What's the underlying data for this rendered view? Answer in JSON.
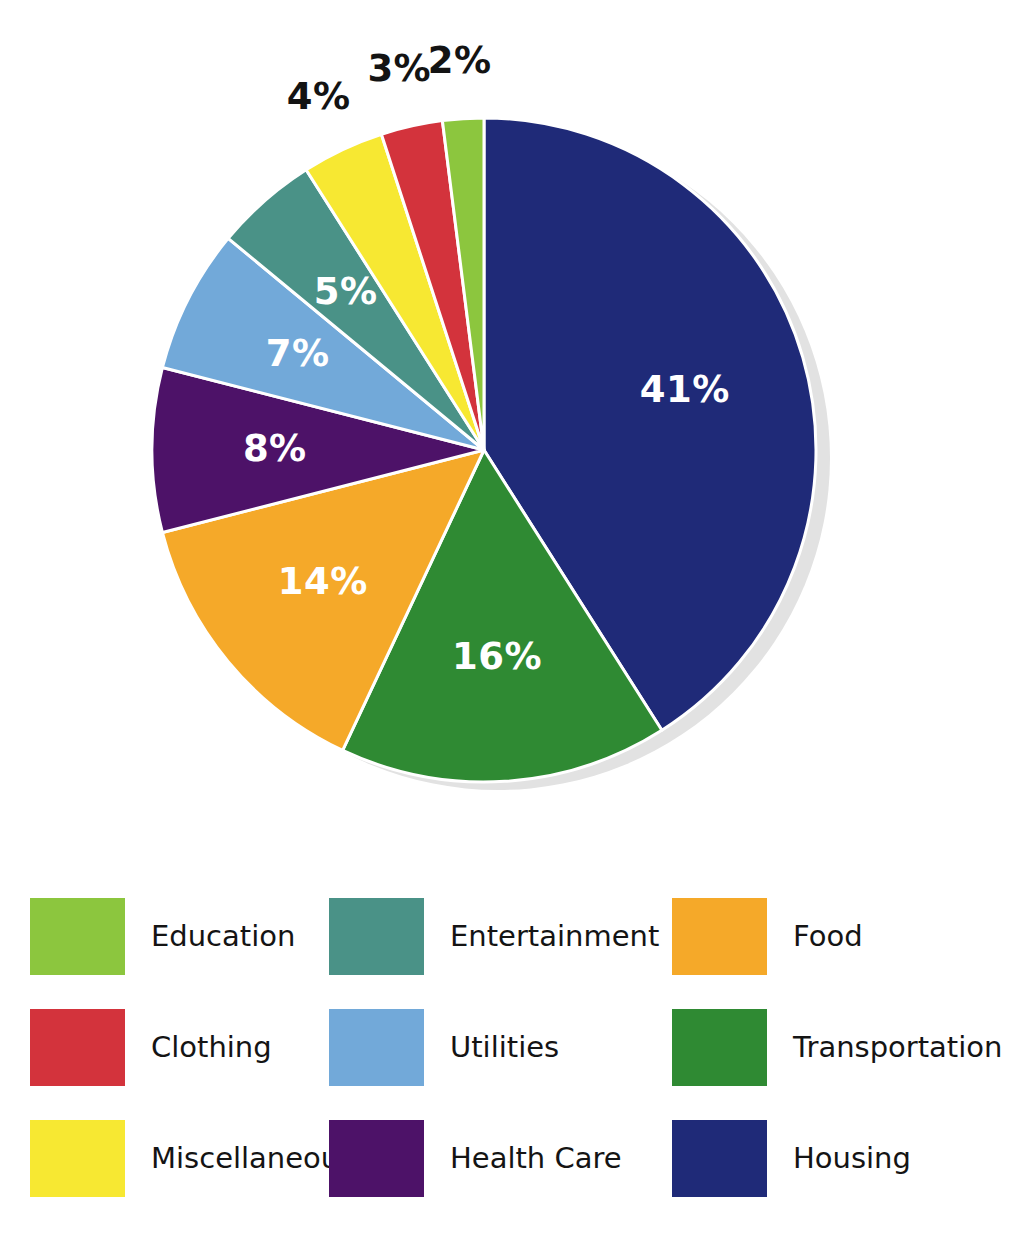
{
  "chart_data": {
    "type": "pie",
    "title": "",
    "subtitle": "",
    "xlabel": "",
    "ylabel": "",
    "grid": false,
    "legend_position": "bottom",
    "units": "percent",
    "total": 100,
    "start_angle_deg": 0,
    "direction": "clockwise",
    "categories": [
      "Housing",
      "Transportation",
      "Food",
      "Health Care",
      "Utilities",
      "Entertainment",
      "Miscellaneous",
      "Clothing",
      "Education"
    ],
    "values": [
      41,
      16,
      14,
      8,
      7,
      5,
      4,
      3,
      2
    ],
    "colors": [
      "#1f2a78",
      "#2f8a33",
      "#f5a929",
      "#4d1268",
      "#72a9d9",
      "#4a9287",
      "#f7e832",
      "#d3333c",
      "#8cc63e"
    ],
    "slices": [
      {
        "label": "Housing",
        "value": 41,
        "display": "41%",
        "color": "#1f2a78",
        "label_placement": "inside",
        "label_color": "#ffffff"
      },
      {
        "label": "Transportation",
        "value": 16,
        "display": "16%",
        "color": "#2f8a33",
        "label_placement": "inside",
        "label_color": "#ffffff"
      },
      {
        "label": "Food",
        "value": 14,
        "display": "14%",
        "color": "#f5a929",
        "label_placement": "inside",
        "label_color": "#ffffff"
      },
      {
        "label": "Health Care",
        "value": 8,
        "display": "8%",
        "color": "#4d1268",
        "label_placement": "inside",
        "label_color": "#ffffff"
      },
      {
        "label": "Utilities",
        "value": 7,
        "display": "7%",
        "color": "#72a9d9",
        "label_placement": "inside",
        "label_color": "#ffffff"
      },
      {
        "label": "Entertainment",
        "value": 5,
        "display": "5%",
        "color": "#4a9287",
        "label_placement": "inside",
        "label_color": "#ffffff"
      },
      {
        "label": "Miscellaneous",
        "value": 4,
        "display": "4%",
        "color": "#f7e832",
        "label_placement": "outside",
        "label_color": "#131313"
      },
      {
        "label": "Clothing",
        "value": 3,
        "display": "3%",
        "color": "#d3333c",
        "label_placement": "outside",
        "label_color": "#131313"
      },
      {
        "label": "Education",
        "value": 2,
        "display": "2%",
        "color": "#8cc63e",
        "label_placement": "outside",
        "label_color": "#131313"
      }
    ]
  },
  "pie": {
    "center_x": 484,
    "center_y": 450,
    "radius": 332,
    "shadow_color": "#e2e2e2",
    "shadow_offset_x": 14,
    "shadow_offset_y": 8,
    "separator_color": "#ffffff",
    "separator_width": 3,
    "labels": {
      "p41": "41%",
      "p16": "16%",
      "p14": "14%",
      "p8": "8%",
      "p7": "7%",
      "p5": "5%",
      "p4": "4%",
      "p3": "3%",
      "p2": "2%"
    }
  },
  "legend": {
    "columns": 3,
    "rows": 3,
    "items": [
      {
        "label": "Education",
        "color": "#8cc63e",
        "col": 0,
        "row": 0
      },
      {
        "label": "Entertainment",
        "color": "#4a9287",
        "col": 1,
        "row": 0
      },
      {
        "label": "Food",
        "color": "#f5a929",
        "col": 2,
        "row": 0
      },
      {
        "label": "Clothing",
        "color": "#d3333c",
        "col": 0,
        "row": 1
      },
      {
        "label": "Utilities",
        "color": "#72a9d9",
        "col": 1,
        "row": 1
      },
      {
        "label": "Transportation",
        "color": "#2f8a33",
        "col": 2,
        "row": 1
      },
      {
        "label": "Miscellaneous",
        "color": "#f7e832",
        "col": 0,
        "row": 2
      },
      {
        "label": "Health Care",
        "color": "#4d1268",
        "col": 1,
        "row": 2
      },
      {
        "label": "Housing",
        "color": "#1f2a78",
        "col": 2,
        "row": 2
      }
    ]
  }
}
